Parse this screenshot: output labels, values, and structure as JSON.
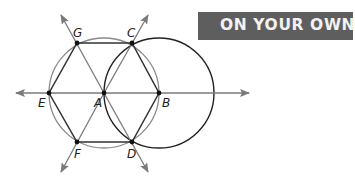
{
  "banner": {
    "text": "ON YOUR OWN",
    "bg_color": "#5e5e5e",
    "text_color": "#f2f2f2"
  },
  "diagram": {
    "points": {
      "G": {
        "label": "G",
        "x": 77,
        "y": 43
      },
      "C": {
        "label": "C",
        "x": 132,
        "y": 43
      },
      "E": {
        "label": "E",
        "x": 49,
        "y": 93
      },
      "A": {
        "label": "A",
        "x": 104,
        "y": 93
      },
      "B": {
        "label": "B",
        "x": 159,
        "y": 93
      },
      "F": {
        "label": "F",
        "x": 77,
        "y": 142
      },
      "D": {
        "label": "D",
        "x": 132,
        "y": 142
      }
    },
    "circles": [
      {
        "center": "A",
        "radius": 55,
        "color": "#8a8a8a"
      },
      {
        "center": "B",
        "radius": 55,
        "color": "#222222"
      }
    ],
    "lines": [
      "line EB (horizontal, arrows both ends)",
      "line GD (arrows both ends)",
      "line CF (arrows both ends)"
    ],
    "hexagon": [
      "G",
      "C",
      "B",
      "D",
      "F",
      "E"
    ],
    "line_color": "#8a8a8a",
    "hexagon_color": "#333333"
  }
}
